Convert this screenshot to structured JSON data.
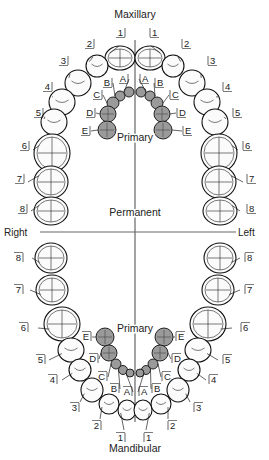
{
  "titles": {
    "top": "Maxillary",
    "bottom": "Mandibular",
    "primary_upper": "Primary",
    "permanent": "Permanent",
    "primary_lower": "Primary",
    "right": "Right",
    "left": "Left"
  },
  "colors": {
    "permanent_fill": "#fbfbfb",
    "primary_fill": "#9a9a9a",
    "outline": "#111111",
    "axis": "#666666"
  },
  "maxillary_permanent": [
    {
      "label": "1",
      "side": "right",
      "tx": 118,
      "ty": 36,
      "cx": 120,
      "cy": 58,
      "rx": 15,
      "ry": 12,
      "lx": 119,
      "ly": 46
    },
    {
      "label": "2",
      "side": "right",
      "tx": 87,
      "ty": 47,
      "cx": 97,
      "cy": 66,
      "rx": 11,
      "ry": 11,
      "lx": 93,
      "ly": 57
    },
    {
      "label": "3",
      "side": "right",
      "tx": 61,
      "ty": 64,
      "cx": 78,
      "cy": 83,
      "rx": 13,
      "ry": 13,
      "lx": 70,
      "ly": 74
    },
    {
      "label": "4",
      "side": "right",
      "tx": 45,
      "ty": 90,
      "cx": 62,
      "cy": 102,
      "rx": 13,
      "ry": 13,
      "lx": 52,
      "ly": 97
    },
    {
      "label": "5",
      "side": "right",
      "tx": 36,
      "ty": 116,
      "cx": 54,
      "cy": 122,
      "rx": 13,
      "ry": 13,
      "lx": 44,
      "ly": 119
    },
    {
      "label": "6",
      "side": "right",
      "tx": 22,
      "ty": 149,
      "cx": 52,
      "cy": 153,
      "rx": 18,
      "ry": 19,
      "lx": 33,
      "ly": 150
    },
    {
      "label": "7",
      "side": "right",
      "tx": 17,
      "ty": 182,
      "cx": 51,
      "cy": 182,
      "rx": 17,
      "ry": 16,
      "lx": 28,
      "ly": 182
    },
    {
      "label": "8",
      "side": "right",
      "tx": 20,
      "ty": 212,
      "cx": 51,
      "cy": 211,
      "rx": 17,
      "ry": 14,
      "lx": 31,
      "ly": 211
    },
    {
      "label": "1",
      "side": "left",
      "tx": 152,
      "ty": 36,
      "cx": 150,
      "cy": 58,
      "rx": 15,
      "ry": 12,
      "lx": 151,
      "ly": 46
    },
    {
      "label": "2",
      "side": "left",
      "tx": 184,
      "ty": 47,
      "cx": 173,
      "cy": 66,
      "rx": 11,
      "ry": 11,
      "lx": 178,
      "ly": 57
    },
    {
      "label": "3",
      "side": "left",
      "tx": 210,
      "ty": 64,
      "cx": 192,
      "cy": 83,
      "rx": 13,
      "ry": 13,
      "lx": 201,
      "ly": 74
    },
    {
      "label": "4",
      "side": "left",
      "tx": 225,
      "ty": 90,
      "cx": 207,
      "cy": 102,
      "rx": 13,
      "ry": 13,
      "lx": 218,
      "ly": 97
    },
    {
      "label": "5",
      "side": "left",
      "tx": 235,
      "ty": 116,
      "cx": 215,
      "cy": 122,
      "rx": 13,
      "ry": 13,
      "lx": 226,
      "ly": 119
    },
    {
      "label": "6",
      "side": "left",
      "tx": 245,
      "ty": 149,
      "cx": 219,
      "cy": 153,
      "rx": 18,
      "ry": 19,
      "lx": 238,
      "ly": 150
    },
    {
      "label": "7",
      "side": "left",
      "tx": 249,
      "ty": 182,
      "cx": 219,
      "cy": 182,
      "rx": 17,
      "ry": 16,
      "lx": 243,
      "ly": 182
    },
    {
      "label": "8",
      "side": "left",
      "tx": 249,
      "ty": 212,
      "cx": 220,
      "cy": 211,
      "rx": 17,
      "ry": 14,
      "lx": 240,
      "ly": 211
    }
  ],
  "maxillary_primary": [
    {
      "label": "A",
      "side": "right",
      "tx": 121,
      "ty": 82,
      "cx": 129,
      "cy": 92,
      "r": 5
    },
    {
      "label": "B",
      "side": "right",
      "tx": 105,
      "ty": 86,
      "cx": 120,
      "cy": 96,
      "r": 5
    },
    {
      "label": "C",
      "side": "right",
      "tx": 95,
      "ty": 98,
      "cx": 113,
      "cy": 103,
      "r": 6
    },
    {
      "label": "D",
      "side": "right",
      "tx": 88,
      "ty": 116,
      "cx": 108,
      "cy": 114,
      "r": 8
    },
    {
      "label": "E",
      "side": "right",
      "tx": 83,
      "ty": 134,
      "cx": 107,
      "cy": 130,
      "r": 9
    },
    {
      "label": "A",
      "side": "left",
      "tx": 142,
      "ty": 82,
      "cx": 141,
      "cy": 92,
      "r": 5
    },
    {
      "label": "B",
      "side": "left",
      "tx": 157,
      "ty": 86,
      "cx": 150,
      "cy": 96,
      "r": 5
    },
    {
      "label": "C",
      "side": "left",
      "tx": 172,
      "ty": 98,
      "cx": 157,
      "cy": 103,
      "r": 6
    },
    {
      "label": "D",
      "side": "left",
      "tx": 179,
      "ty": 116,
      "cx": 162,
      "cy": 114,
      "r": 8
    },
    {
      "label": "E",
      "side": "left",
      "tx": 185,
      "ty": 134,
      "cx": 163,
      "cy": 130,
      "r": 9
    }
  ],
  "mandibular_permanent": [
    {
      "label": "8",
      "side": "right",
      "tx": 16,
      "ty": 261,
      "cx": 51,
      "cy": 258,
      "rx": 16,
      "ry": 15,
      "lx": 32,
      "ly": 258
    },
    {
      "label": "7",
      "side": "right",
      "tx": 16,
      "ty": 293,
      "cx": 52,
      "cy": 290,
      "rx": 16,
      "ry": 15,
      "lx": 30,
      "ly": 290
    },
    {
      "label": "6",
      "side": "right",
      "tx": 21,
      "ty": 331,
      "cx": 62,
      "cy": 324,
      "rx": 18,
      "ry": 17,
      "lx": 38,
      "ly": 328
    },
    {
      "label": "5",
      "side": "right",
      "tx": 38,
      "ty": 363,
      "cx": 71,
      "cy": 350,
      "rx": 13,
      "ry": 12,
      "lx": 49,
      "ly": 360
    },
    {
      "label": "4",
      "side": "right",
      "tx": 50,
      "ty": 383,
      "cx": 80,
      "cy": 370,
      "rx": 11,
      "ry": 11,
      "lx": 62,
      "ly": 380
    },
    {
      "label": "3",
      "side": "right",
      "tx": 72,
      "ty": 411,
      "cx": 92,
      "cy": 390,
      "rx": 11,
      "ry": 12,
      "lx": 80,
      "ly": 402
    },
    {
      "label": "2",
      "side": "right",
      "tx": 94,
      "ty": 429,
      "cx": 109,
      "cy": 404,
      "rx": 10,
      "ry": 10,
      "lx": 100,
      "ly": 419
    },
    {
      "label": "1",
      "side": "right",
      "tx": 118,
      "ty": 441,
      "cx": 127,
      "cy": 410,
      "rx": 9,
      "ry": 10,
      "lx": 124,
      "ly": 430
    },
    {
      "label": "8",
      "side": "left",
      "tx": 247,
      "ty": 261,
      "cx": 220,
      "cy": 258,
      "rx": 16,
      "ry": 15,
      "lx": 240,
      "ly": 258
    },
    {
      "label": "7",
      "side": "left",
      "tx": 247,
      "ty": 293,
      "cx": 218,
      "cy": 290,
      "rx": 16,
      "ry": 15,
      "lx": 240,
      "ly": 290
    },
    {
      "label": "6",
      "side": "left",
      "tx": 243,
      "ty": 331,
      "cx": 208,
      "cy": 324,
      "rx": 18,
      "ry": 17,
      "lx": 232,
      "ly": 328
    },
    {
      "label": "5",
      "side": "left",
      "tx": 225,
      "ty": 363,
      "cx": 198,
      "cy": 350,
      "rx": 13,
      "ry": 12,
      "lx": 218,
      "ly": 360
    },
    {
      "label": "4",
      "side": "left",
      "tx": 211,
      "ty": 383,
      "cx": 189,
      "cy": 370,
      "rx": 11,
      "ry": 11,
      "lx": 206,
      "ly": 380
    },
    {
      "label": "3",
      "side": "left",
      "tx": 196,
      "ty": 411,
      "cx": 178,
      "cy": 390,
      "rx": 11,
      "ry": 12,
      "lx": 190,
      "ly": 402
    },
    {
      "label": "2",
      "side": "left",
      "tx": 170,
      "ty": 429,
      "cx": 161,
      "cy": 404,
      "rx": 10,
      "ry": 10,
      "lx": 168,
      "ly": 419
    },
    {
      "label": "1",
      "side": "left",
      "tx": 146,
      "ty": 441,
      "cx": 143,
      "cy": 410,
      "rx": 9,
      "ry": 10,
      "lx": 146,
      "ly": 430
    }
  ],
  "mandibular_primary": [
    {
      "label": "E",
      "side": "right",
      "tx": 84,
      "ty": 340,
      "cx": 105,
      "cy": 337,
      "r": 9
    },
    {
      "label": "D",
      "side": "right",
      "tx": 91,
      "ty": 362,
      "cx": 109,
      "cy": 353,
      "r": 8
    },
    {
      "label": "C",
      "side": "right",
      "tx": 100,
      "ty": 380,
      "cx": 116,
      "cy": 364,
      "r": 5
    },
    {
      "label": "B",
      "side": "right",
      "tx": 112,
      "ty": 392,
      "cx": 123,
      "cy": 370,
      "r": 4.5
    },
    {
      "label": "A",
      "side": "right",
      "tx": 125,
      "ty": 395,
      "cx": 130,
      "cy": 373,
      "r": 4
    },
    {
      "label": "E",
      "side": "left",
      "tx": 178,
      "ty": 340,
      "cx": 164,
      "cy": 337,
      "r": 9
    },
    {
      "label": "D",
      "side": "left",
      "tx": 174,
      "ty": 362,
      "cx": 160,
      "cy": 353,
      "r": 8
    },
    {
      "label": "C",
      "side": "left",
      "tx": 164,
      "ty": 380,
      "cx": 153,
      "cy": 364,
      "r": 5
    },
    {
      "label": "B",
      "side": "left",
      "tx": 154,
      "ty": 392,
      "cx": 146,
      "cy": 370,
      "r": 4.5
    },
    {
      "label": "A",
      "side": "left",
      "tx": 141,
      "ty": 395,
      "cx": 140,
      "cy": 373,
      "r": 4
    }
  ]
}
